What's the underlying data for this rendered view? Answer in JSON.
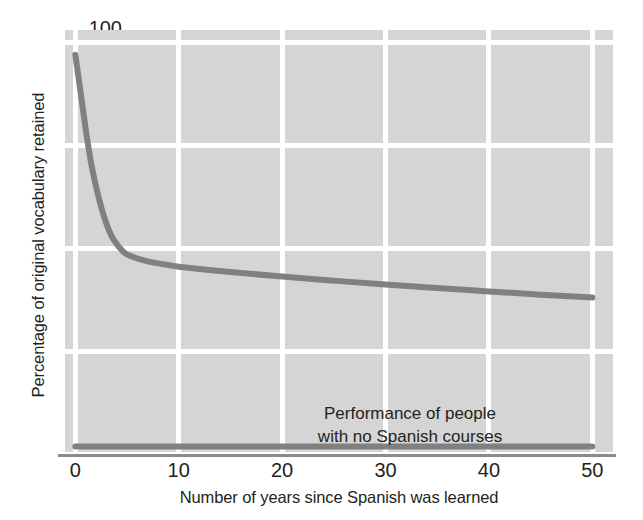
{
  "chart_data": {
    "type": "line",
    "title": "",
    "xlabel": "Number of years since Spanish was learned",
    "ylabel": "Percentage of original vocabulary retained",
    "xlim": [
      -1,
      52
    ],
    "ylim": [
      0,
      103
    ],
    "xticks": [
      0,
      10,
      20,
      30,
      40,
      50
    ],
    "xtick_labels": [
      "0",
      "10",
      "20",
      "30",
      "40",
      "50"
    ],
    "yticks": [
      0,
      25,
      50,
      75,
      100
    ],
    "ytick_labels": [
      "0",
      "25",
      "50",
      "75",
      "100"
    ],
    "grid": true,
    "grid_color": "#ffffff",
    "plot_background": "#d5d5d5",
    "legend": "none",
    "annotations": [
      {
        "lines": [
          "Performance of people",
          "with no Spanish courses"
        ],
        "x": 30,
        "y": 12
      }
    ],
    "series": [
      {
        "name": "Retention of original vocabulary",
        "color": "#808080",
        "linewidth": 6,
        "x": [
          0,
          0.5,
          1,
          1.5,
          2,
          2.5,
          3,
          3.5,
          4,
          4.5,
          5,
          6,
          7,
          8,
          9,
          10,
          15,
          20,
          25,
          30,
          35,
          40,
          45,
          50
        ],
        "y": [
          97,
          88,
          79,
          71,
          65,
          60,
          56,
          53,
          51,
          49.5,
          48.5,
          47.5,
          46.8,
          46.3,
          45.9,
          45.5,
          44.2,
          43.1,
          42.1,
          41.2,
          40.3,
          39.5,
          38.7,
          38.0
        ]
      },
      {
        "name": "Performance of people with no Spanish courses",
        "color": "#808080",
        "linewidth": 6,
        "x": [
          0,
          10,
          20,
          30,
          40,
          50
        ],
        "y": [
          1.8,
          1.8,
          1.8,
          1.8,
          1.8,
          1.8
        ]
      }
    ]
  }
}
